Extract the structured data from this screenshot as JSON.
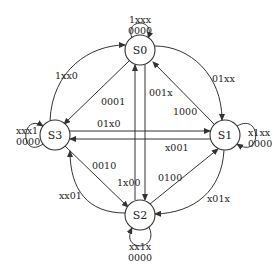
{
  "diagram": {
    "type": "state-transition-diagram",
    "states": [
      {
        "id": "S0",
        "label": "S0",
        "self_loop": {
          "input": "1xxx",
          "output": "0000"
        }
      },
      {
        "id": "S1",
        "label": "S1",
        "self_loop": {
          "input": "x1xx",
          "output": "0000"
        }
      },
      {
        "id": "S2",
        "label": "S2",
        "self_loop": {
          "input": "xx1x",
          "output": "0000"
        }
      },
      {
        "id": "S3",
        "label": "S3",
        "self_loop": {
          "input": "xxx1",
          "output": "0000"
        }
      }
    ],
    "transitions": [
      {
        "from": "S0",
        "to": "S1",
        "label": "01xx"
      },
      {
        "from": "S1",
        "to": "S0",
        "label": "1000"
      },
      {
        "from": "S0",
        "to": "S2",
        "label": "001x"
      },
      {
        "from": "S2",
        "to": "S0",
        "label": ""
      },
      {
        "from": "S0",
        "to": "S3",
        "label": "0001"
      },
      {
        "from": "S3",
        "to": "S0",
        "label": "1xx0"
      },
      {
        "from": "S3",
        "to": "S1",
        "label": "01x0"
      },
      {
        "from": "S1",
        "to": "S3",
        "label": "x001"
      },
      {
        "from": "S3",
        "to": "S2",
        "label": "0010"
      },
      {
        "from": "S2",
        "to": "S3",
        "label": "xx01"
      },
      {
        "from": "S2",
        "to": "S1",
        "label": "0100"
      },
      {
        "from": "S1",
        "to": "S2",
        "label": "x01x"
      },
      {
        "from": "S2",
        "to": "S0",
        "label": "1x00"
      }
    ]
  },
  "labels": {
    "s0": "S0",
    "s1": "S1",
    "s2": "S2",
    "s3": "S3",
    "s0_loop_in": "1xxx",
    "s0_loop_out": "0000",
    "s1_loop_in": "x1xx",
    "s1_loop_out": "0000",
    "s2_loop_in": "xx1x",
    "s2_loop_out": "0000",
    "s3_loop_in": "xxx1",
    "s3_loop_out": "0000",
    "e_1xx0": "1xx0",
    "e_0001": "0001",
    "e_001x": "001x",
    "e_01xx": "01xx",
    "e_1000": "1000",
    "e_01x0": "01x0",
    "e_x001": "x001",
    "e_0010": "0010",
    "e_1x00": "1x00",
    "e_0100": "0100",
    "e_xx01": "xx01",
    "e_x01x": "x01x"
  }
}
